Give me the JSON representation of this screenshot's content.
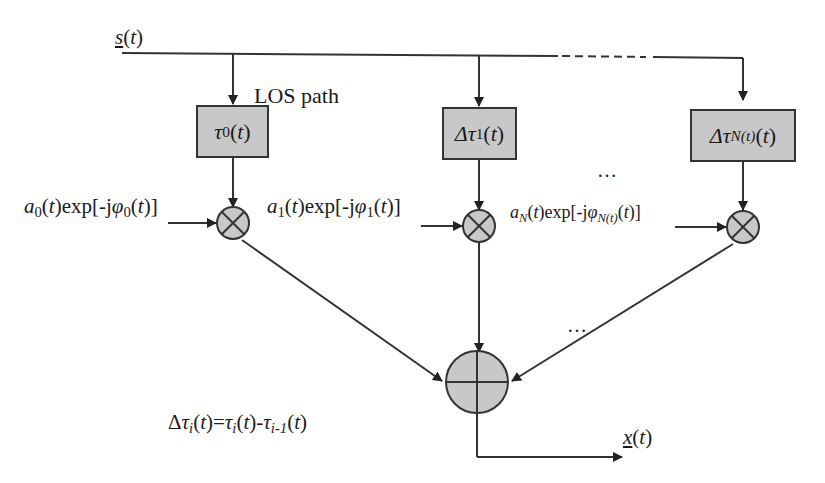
{
  "diagram": {
    "type": "multipath channel model block diagram",
    "input_signal": {
      "label": "s(t)",
      "underlined": true
    },
    "output_signal": {
      "label": "x(t)",
      "underlined": true
    },
    "los_label": "LOS path",
    "branches": [
      {
        "delay_block": "τ0(t)",
        "delay_symbol": "τ",
        "delay_sub": "0",
        "delay_prefix": "",
        "gain": "a0(t)exp[-jφ0(t)]",
        "gain_a_sub": "0",
        "gain_phi_sub": "0"
      },
      {
        "delay_block": "Δτ1(t)",
        "delay_symbol": "τ",
        "delay_sub": "1",
        "delay_prefix": "Δ",
        "gain": "a1(t)exp[-jφ1(t)]",
        "gain_a_sub": "1",
        "gain_phi_sub": "1"
      },
      {
        "delay_block": "ΔτN(t)(t)",
        "delay_symbol": "τ",
        "delay_sub": "N(t)",
        "delay_prefix": "Δ",
        "gain": "aN(t)exp[-jφN(t)(t)]",
        "gain_a_sub": "N",
        "gain_phi_sub": "N(t)"
      }
    ],
    "ellipsis": "…",
    "multiplier_symbol": "⊗",
    "adder_symbol": "⊕",
    "equation": "Δτi(t)=τi(t)-τi-1(t)",
    "colors": {
      "block_fill": "#c8c8c8",
      "stroke": "#333333",
      "background": "#ffffff"
    },
    "text": {
      "s": "s",
      "x": "x",
      "t": "t",
      "open": "(",
      "close": ")",
      "tau": "τ",
      "delta": "Δ",
      "a": "a",
      "phi": "φ",
      "exp": "exp[-j",
      "rb": "]",
      "i": "i",
      "im1": "i-1",
      "eq": "=",
      "minus": "-"
    }
  }
}
